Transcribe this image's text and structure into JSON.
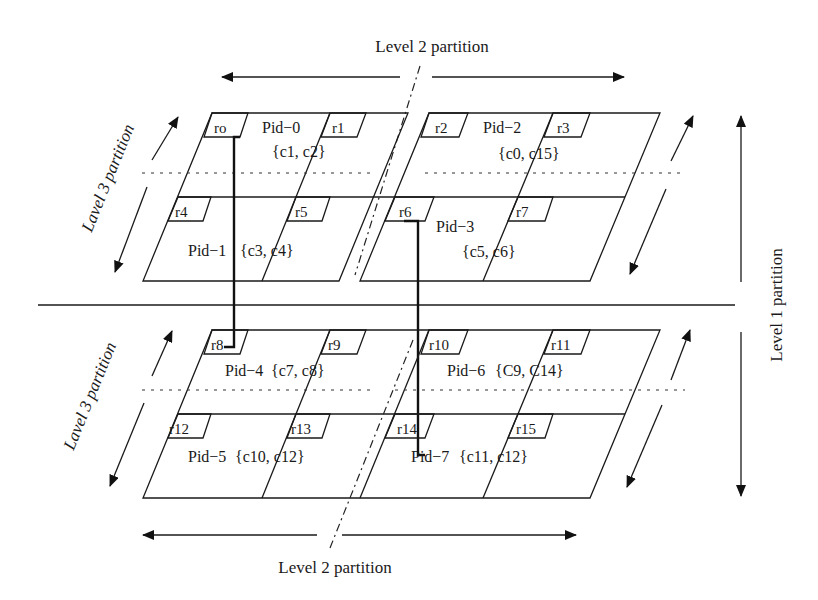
{
  "labels": {
    "level2_top": "Level 2 partition",
    "level2_bottom": "Level 2 partition",
    "level1": "Level 1 partition",
    "level3_top": "Lavel 3 partition",
    "level3_bottom": "Lavel 3 partition"
  },
  "upper_plane": {
    "partitions": [
      {
        "pid": "Pid−0",
        "cores": "{c1, c2}"
      },
      {
        "pid": "Pid−1",
        "cores": "{c3, c4}"
      },
      {
        "pid": "Pid−2",
        "cores": "{c0, c15}"
      },
      {
        "pid": "Pid−3",
        "cores": "{c5, c6}"
      }
    ],
    "routers": [
      "ro",
      "r1",
      "r2",
      "r3",
      "r4",
      "r5",
      "r6",
      "r7"
    ]
  },
  "lower_plane": {
    "partitions": [
      {
        "pid": "Pid−4",
        "cores": "{c7, c8}"
      },
      {
        "pid": "Pid−5",
        "cores": "{c10, c12}"
      },
      {
        "pid": "Pid−6",
        "cores": "{C9, C14}"
      },
      {
        "pid": "Pid−7",
        "cores": "{c11, c12}"
      }
    ],
    "routers": [
      "r8",
      "r9",
      "r10",
      "r11",
      "r12",
      "r13",
      "r14",
      "r15"
    ]
  },
  "colors": {
    "line": "#1a1a1a",
    "background": "#ffffff"
  }
}
